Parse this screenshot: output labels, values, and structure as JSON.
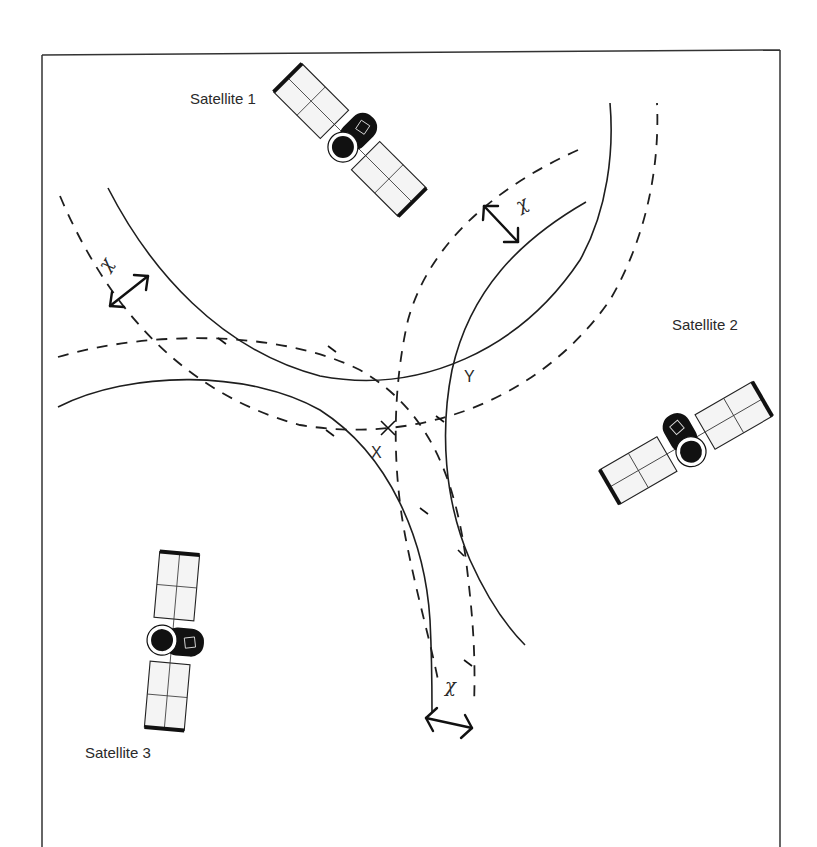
{
  "diagram": {
    "type": "satellite-positioning-intersection",
    "satellites": [
      {
        "id": "sat1",
        "label": "Satellite 1",
        "label_pos": [
          190,
          104
        ],
        "center": [
          350,
          140
        ],
        "angle": 45
      },
      {
        "id": "sat2",
        "label": "Satellite 2",
        "label_pos": [
          672,
          330
        ],
        "center": [
          686,
          443
        ],
        "angle": -30
      },
      {
        "id": "sat3",
        "label": "Satellite 3",
        "label_pos": [
          85,
          758
        ],
        "center": [
          172,
          641
        ],
        "angle": 5
      }
    ],
    "points": [
      {
        "id": "X",
        "label": "X",
        "pos": [
          388,
          428
        ],
        "label_pos": [
          371,
          458
        ]
      },
      {
        "id": "Y",
        "label": "Y",
        "pos": [
          455,
          360
        ],
        "label_pos": [
          464,
          382
        ]
      }
    ],
    "uncertainty_markers": [
      {
        "id": "chi-sat1",
        "symbol": "χ",
        "label_pos": [
          112,
          268
        ],
        "label_rotate": -60,
        "arrow": [
          [
            110,
            306
          ],
          [
            148,
            276
          ]
        ]
      },
      {
        "id": "chi-sat2",
        "symbol": "χ",
        "label_pos": [
          524,
          206
        ],
        "label_rotate": -30,
        "arrow": [
          [
            484,
            206
          ],
          [
            518,
            242
          ]
        ]
      },
      {
        "id": "chi-sat3",
        "symbol": "χ",
        "label_pos": [
          450,
          688
        ],
        "label_rotate": 0,
        "arrow": [
          [
            426,
            718
          ],
          [
            472,
            728
          ]
        ]
      }
    ],
    "colors": {
      "line": "#1e1e1e",
      "background": "#ffffff",
      "panel_fill": "#f4f4f4",
      "text": "#2a2a2a"
    }
  }
}
